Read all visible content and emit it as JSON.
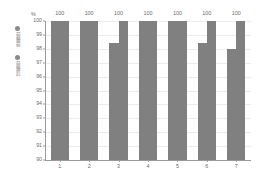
{
  "chart_data": {
    "type": "bar",
    "title": "",
    "subtitle": "",
    "xlabel": "",
    "ylabel": "%",
    "categories": [
      "1",
      "2",
      "3",
      "4",
      "5",
      "6",
      "7"
    ],
    "series": [
      {
        "name": "前膜前",
        "values": [
          100,
          100,
          98.4,
          100,
          100,
          98.4,
          98.0
        ],
        "color": "#808080"
      },
      {
        "name": "前膜后",
        "values": [
          100,
          100,
          100,
          100,
          100,
          100,
          100
        ],
        "color": "#808080",
        "data_labels": [
          "100",
          "100",
          "100",
          "100",
          "100",
          "100",
          "100"
        ]
      }
    ],
    "ylim": [
      90,
      100
    ],
    "ytick_labels": [
      "100",
      "99",
      "98",
      "97",
      "96",
      "95",
      "94",
      "93",
      "92",
      "91",
      "90"
    ],
    "ytick_values": [
      100,
      99,
      98,
      97,
      96,
      95,
      94,
      93,
      92,
      91,
      90
    ],
    "grid": "horizontal",
    "legend_position": "left-outside",
    "bar_color": "#808080",
    "grid_color": "#ececec",
    "axis_color": "#9a9a9a",
    "text_color": "#6b6b6b"
  },
  "legend": {
    "entries": [
      {
        "label": "前膜前",
        "marker": "circle-marker"
      },
      {
        "label": "前膜后",
        "marker": "circle-marker"
      }
    ]
  }
}
